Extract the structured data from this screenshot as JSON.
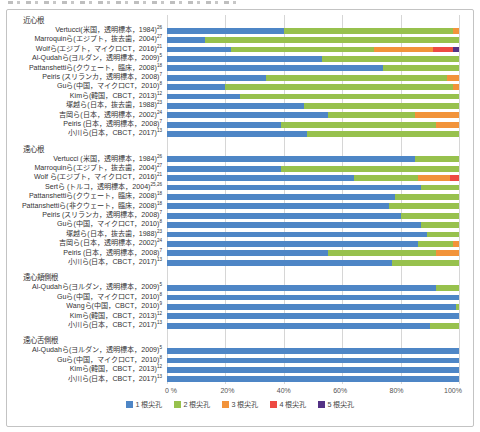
{
  "chart_data": {
    "type": "bar",
    "orientation": "horizontal-stacked",
    "unit": "percent",
    "xlim": [
      0,
      100
    ],
    "grid": "vertical-lines-at-20pct",
    "legend_position": "bottom-center",
    "x_ticks": [
      "0 %",
      "20%",
      "40%",
      "60%",
      "80%",
      "100%"
    ],
    "legend": [
      {
        "label": "1 根尖孔",
        "color": "#4e86c6"
      },
      {
        "label": "2 根尖孔",
        "color": "#97c14d"
      },
      {
        "label": "3 根尖孔",
        "color": "#f2933a"
      },
      {
        "label": "4 根尖孔",
        "color": "#ee4a42"
      },
      {
        "label": "5 根尖孔",
        "color": "#533285"
      }
    ],
    "groups": [
      {
        "name": "近心根",
        "rows": [
          {
            "label": "Vertucci(米国，透明標本，1984)",
            "ref": "26",
            "values": [
              40,
              58,
              2,
              0,
              0
            ]
          },
          {
            "label": "Marroquinら(エジプト，抜去歯，2004)",
            "ref": "27",
            "values": [
              13,
              87,
              0,
              0,
              0
            ]
          },
          {
            "label": "Wolfら(エジプト，マイクロCT，2016)",
            "ref": "21",
            "values": [
              22,
              49,
              20,
              7,
              2
            ]
          },
          {
            "label": "Al-Qudahら(ヨルダン，透明標本，2009)",
            "ref": "5",
            "values": [
              53,
              47,
              0,
              0,
              0
            ]
          },
          {
            "label": "Pattanshettiら(クウェート，臨床，2008)",
            "ref": "18",
            "values": [
              74,
              26,
              0,
              0,
              0
            ]
          },
          {
            "label": "Peiris (スリランカ，透明標本，2008)",
            "ref": "7",
            "values": [
              34,
              62,
              4,
              0,
              0
            ]
          },
          {
            "label": "Guら(中国，マイクロCT，2010)",
            "ref": "8",
            "values": [
              20,
              78,
              2,
              0,
              0
            ]
          },
          {
            "label": "Kimら(韓国，CBCT，2013)",
            "ref": "12",
            "values": [
              25,
              75,
              0,
              0,
              0
            ]
          },
          {
            "label": "塚越ら(日本，抜去歯，1988)",
            "ref": "23",
            "values": [
              47,
              53,
              0,
              0,
              0
            ]
          },
          {
            "label": "吉岡ら(日本，透明標本，2002)",
            "ref": "24",
            "values": [
              55,
              30,
              15,
              0,
              0
            ]
          },
          {
            "label": "Peiris (日本，透明標本，2008)",
            "ref": "7",
            "values": [
              39,
              53,
              8,
              0,
              0
            ]
          },
          {
            "label": "小川ら(日本，CBCT，2017)",
            "ref": "13",
            "values": [
              48,
              52,
              0,
              0,
              0
            ]
          }
        ]
      },
      {
        "name": "遠心根",
        "rows": [
          {
            "label": "Vertucci (米国，透明標本，1984)",
            "ref": "26",
            "values": [
              85,
              15,
              0,
              0,
              0
            ]
          },
          {
            "label": "Marroquinら(エジプト，抜去歯，2004)",
            "ref": "27",
            "values": [
              39,
              61,
              0,
              0,
              0
            ]
          },
          {
            "label": "Wolf ら(エジプト，マイクロCT，2016)",
            "ref": "21",
            "values": [
              64,
              22,
              11,
              3,
              0
            ]
          },
          {
            "label": "Sertら (トルコ，透明標本，2004)",
            "ref": "25,26",
            "values": [
              87,
              13,
              0,
              0,
              0
            ]
          },
          {
            "label": "Pattanshettiら(クウェート，臨床，2008)",
            "ref": "18",
            "values": [
              78,
              22,
              0,
              0,
              0
            ]
          },
          {
            "label": "Pattanshettiら(非クウェート，臨床，2008)",
            "ref": "18",
            "values": [
              76,
              24,
              0,
              0,
              0
            ]
          },
          {
            "label": "Peiris (スリランカ，透明標本，2008)",
            "ref": "7",
            "values": [
              80,
              20,
              0,
              0,
              0
            ]
          },
          {
            "label": "Guら(中国，マイクロCT，2010)",
            "ref": "8",
            "values": [
              87,
              13,
              0,
              0,
              0
            ]
          },
          {
            "label": "塚越ら(日本，抜去歯，1988)",
            "ref": "23",
            "values": [
              89,
              11,
              0,
              0,
              0
            ]
          },
          {
            "label": "吉岡ら(日本，透明標本，2002)",
            "ref": "24",
            "values": [
              86,
              12,
              2,
              0,
              0
            ]
          },
          {
            "label": "Peiris (日本，透明標本，2008)",
            "ref": "7",
            "values": [
              55,
              37,
              8,
              0,
              0
            ]
          },
          {
            "label": "小川ら(日本，CBCT，2017)",
            "ref": "13",
            "values": [
              77,
              23,
              0,
              0,
              0
            ]
          }
        ]
      },
      {
        "name": "遠心頬側根",
        "rows": [
          {
            "label": "Al-Qudahら(ヨルダン，透明標本，2009)",
            "ref": "5",
            "values": [
              92,
              8,
              0,
              0,
              0
            ]
          },
          {
            "label": "Guら(中国，マイクロCT，2010)",
            "ref": "8",
            "values": [
              100,
              0,
              0,
              0,
              0
            ]
          },
          {
            "label": "Wangら(中国，CBCT，2010)",
            "ref": "9",
            "values": [
              99,
              1,
              0,
              0,
              0
            ]
          },
          {
            "label": "Kimら(韓国，CBCT，2013)",
            "ref": "12",
            "values": [
              100,
              0,
              0,
              0,
              0
            ]
          },
          {
            "label": "小川ら(日本，CBCT，2017)",
            "ref": "13",
            "values": [
              90,
              10,
              0,
              0,
              0
            ]
          }
        ]
      },
      {
        "name": "遠心舌側根",
        "rows": [
          {
            "label": "Al-Qudahら(ヨルダン，透明標本，2009)",
            "ref": "5",
            "values": [
              100,
              0,
              0,
              0,
              0
            ]
          },
          {
            "label": "Guら(中国，マイクロCT，2010)",
            "ref": "8",
            "values": [
              100,
              0,
              0,
              0,
              0
            ]
          },
          {
            "label": "Kimら(韓国，CBCT，2013)",
            "ref": "12",
            "values": [
              100,
              0,
              0,
              0,
              0
            ]
          },
          {
            "label": "小川ら(日本，CBCT，2017)",
            "ref": "13",
            "values": [
              100,
              0,
              0,
              0,
              0
            ]
          }
        ]
      }
    ]
  }
}
